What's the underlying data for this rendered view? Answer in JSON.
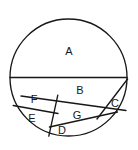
{
  "figure": {
    "type": "geometry-diagram",
    "shape": "circle",
    "canvas": {
      "width": 138,
      "height": 150
    },
    "background_color": "#ffffff",
    "stroke_color": "#171717",
    "fill_color": "#ffffff",
    "stroke_width": 1.35,
    "circle": {
      "cx": 68.5,
      "cy": 77.5,
      "r": 58.5
    },
    "region_count": 7,
    "regions": [
      {
        "id": "A",
        "label": "A",
        "label_x": 69,
        "label_y": 52,
        "note": "upper semicircle above the horizontal diameter"
      },
      {
        "id": "B",
        "label": "B",
        "label_x": 80,
        "label_y": 91,
        "note": "upper-right region of lower half"
      },
      {
        "id": "C",
        "label": "C",
        "label_x": 115,
        "label_y": 104,
        "note": "small right-edge sliver region"
      },
      {
        "id": "D",
        "label": "D",
        "label_x": 62,
        "label_y": 131,
        "note": "lower middle region"
      },
      {
        "id": "E",
        "label": "E",
        "label_x": 32,
        "label_y": 119,
        "note": "left lower region"
      },
      {
        "id": "F",
        "label": "F",
        "label_x": 34,
        "label_y": 100,
        "note": "left upper region of lower half"
      },
      {
        "id": "G",
        "label": "G",
        "label_x": 77,
        "label_y": 116,
        "note": "middle region of lower half"
      }
    ],
    "segments": [
      {
        "name": "horizontal-diameter",
        "x1": 10,
        "y1": 77.5,
        "x2": 127,
        "y2": 77.5
      },
      {
        "name": "chord-b-g-divider",
        "x1": 21,
        "y1": 96,
        "x2": 126,
        "y2": 110
      },
      {
        "name": "chord-c-divider",
        "x1": 127.5,
        "y1": 79,
        "x2": 97,
        "y2": 119
      },
      {
        "name": "chord-f-e-divider",
        "x1": 13.5,
        "y1": 106,
        "x2": 58,
        "y2": 113.5
      },
      {
        "name": "chord-left-vertical",
        "x1": 57.5,
        "y1": 95,
        "x2": 49,
        "y2": 136
      },
      {
        "name": "chord-g-d-divider",
        "x1": 49.5,
        "y1": 127,
        "x2": 117,
        "y2": 112
      }
    ]
  }
}
